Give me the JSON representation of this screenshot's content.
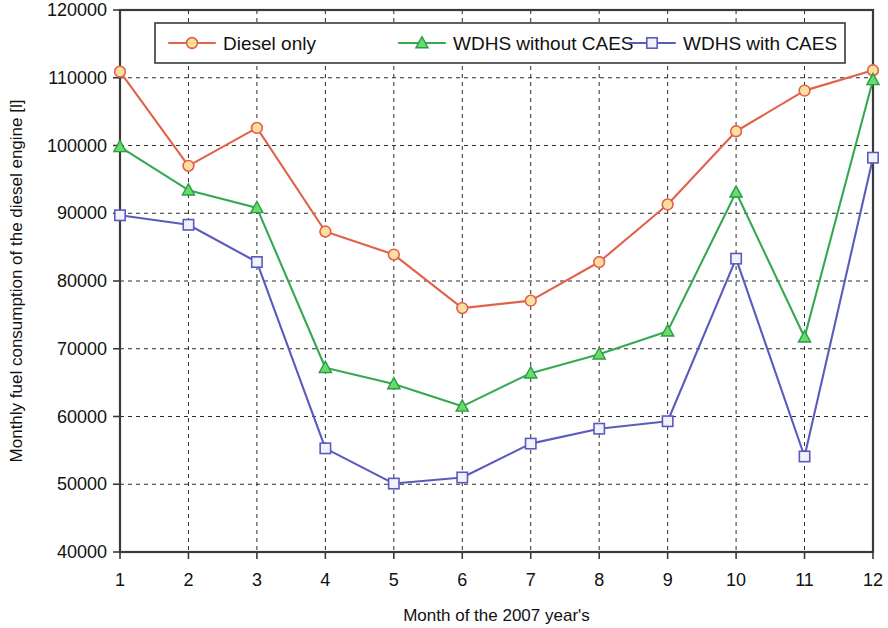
{
  "chart_data": {
    "type": "line",
    "title": "",
    "xlabel": "Month of the 2007 year's",
    "ylabel": "Monthly fuel consumption of the diesel engine [l]",
    "categories": [
      1,
      2,
      3,
      4,
      5,
      6,
      7,
      8,
      9,
      10,
      11,
      12
    ],
    "x_tick_labels": [
      "1",
      "2",
      "3",
      "4",
      "5",
      "6",
      "7",
      "8",
      "9",
      "10",
      "11",
      "12"
    ],
    "y_tick_labels": [
      "40000",
      "50000",
      "60000",
      "70000",
      "80000",
      "90000",
      "100000",
      "110000",
      "120000"
    ],
    "y_ticks": [
      40000,
      50000,
      60000,
      70000,
      80000,
      90000,
      100000,
      110000,
      120000
    ],
    "ylim": [
      40000,
      120000
    ],
    "xlim": [
      1,
      12
    ],
    "grid": true,
    "legend_position": "top-center",
    "series": [
      {
        "name": "Diesel only",
        "color": "#e2614a",
        "marker": "circle",
        "marker_fill": "#fbdf9e",
        "marker_stroke": "#e2614a",
        "values": [
          110900,
          97000,
          102600,
          87300,
          83900,
          76000,
          77100,
          82800,
          91300,
          102100,
          108100,
          111100
        ]
      },
      {
        "name": "WDHS without CAES",
        "color": "#35a853",
        "marker": "triangle",
        "marker_fill": "#66dd66",
        "marker_stroke": "#2f9a4a",
        "values": [
          99800,
          93400,
          90800,
          67200,
          64800,
          61500,
          66400,
          69200,
          72600,
          93100,
          71700,
          109700
        ]
      },
      {
        "name": "WDHS with CAES",
        "color": "#5b5bbe",
        "marker": "square",
        "marker_fill": "#f2f2fc",
        "marker_stroke": "#5b5bbe",
        "values": [
          89700,
          88300,
          82800,
          55300,
          50100,
          51000,
          56000,
          58200,
          59300,
          83300,
          54100,
          98200
        ]
      }
    ]
  },
  "layout": {
    "plot": {
      "left": 120,
      "top": 10,
      "right": 873,
      "bottom": 552
    },
    "legend": {
      "x": 155,
      "y": 23,
      "width": 690,
      "height": 40
    }
  }
}
